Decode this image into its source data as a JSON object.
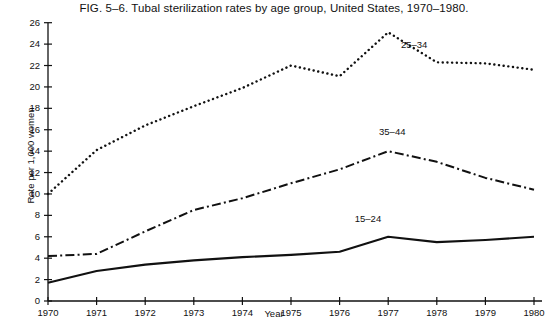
{
  "figure": {
    "title": "FIG. 5–6.    Tubal sterilization rates by age group, United States, 1970–1980.",
    "xlabel": "Year",
    "ylabel": "Rate per 1,000 women"
  },
  "chart_data": {
    "type": "line",
    "title": "FIG. 5–6.    Tubal sterilization rates by age group, United States, 1970–1980.",
    "xlabel": "Year",
    "ylabel": "Rate per 1,000 women",
    "x": [
      1970,
      1971,
      1972,
      1973,
      1974,
      1975,
      1976,
      1977,
      1978,
      1979,
      1980
    ],
    "xtick_labels": [
      "1970",
      "1971",
      "1972",
      "1973",
      "1974",
      "1975",
      "1976",
      "1977",
      "1978",
      "1979",
      "1980"
    ],
    "ytick_labels": [
      "0",
      "2",
      "4",
      "6",
      "8",
      "10",
      "12",
      "14",
      "16",
      "18",
      "20",
      "22",
      "24",
      "26"
    ],
    "yticks": [
      0,
      2,
      4,
      6,
      8,
      10,
      12,
      14,
      16,
      18,
      20,
      22,
      24,
      26
    ],
    "xlim": [
      1970,
      1980
    ],
    "ylim": [
      0,
      26
    ],
    "grid": false,
    "legend_position": "inline-annotations",
    "series": [
      {
        "name": "25–34",
        "label": "25–34",
        "linestyle": "dotted",
        "color": "#111111",
        "values": [
          10.0,
          14.1,
          16.4,
          18.2,
          19.9,
          22.0,
          21.0,
          25.1,
          22.3,
          22.2,
          21.6
        ],
        "label_x": 1977.55,
        "label_y": 23.8
      },
      {
        "name": "35–44",
        "label": "35–44",
        "linestyle": "dashdot",
        "color": "#111111",
        "values": [
          4.2,
          4.4,
          6.5,
          8.5,
          9.6,
          11.0,
          12.3,
          14.0,
          13.0,
          11.5,
          10.4
        ],
        "label_x": 1977.1,
        "label_y": 15.7
      },
      {
        "name": "15–24",
        "label": "15–24",
        "linestyle": "solid",
        "color": "#111111",
        "values": [
          1.7,
          2.8,
          3.4,
          3.8,
          4.1,
          4.3,
          4.6,
          6.0,
          5.5,
          5.7,
          6.0
        ],
        "label_x": 1976.6,
        "label_y": 7.6
      }
    ]
  }
}
